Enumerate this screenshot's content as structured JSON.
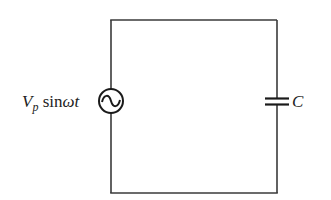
{
  "diagram": {
    "type": "circuit",
    "title": "",
    "source": {
      "kind": "ac-voltage-source",
      "label_main": "V",
      "label_sub": "p",
      "label_func": " sin",
      "label_omega": "ω",
      "label_t": "t",
      "full_label": "Vp sinωt"
    },
    "capacitor": {
      "kind": "capacitor",
      "label": "C"
    },
    "colors": {
      "wire": "#3a3a3a",
      "symbol": "#1a1a1a",
      "background": "#ffffff"
    }
  }
}
